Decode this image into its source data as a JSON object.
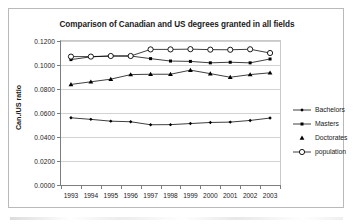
{
  "chart_data": {
    "type": "line",
    "title": "Comparison of Canadian and US degrees granted in all fields",
    "xlabel": "",
    "ylabel": "Can./US ratio",
    "grid": true,
    "legend_position": "right",
    "x": [
      "1993",
      "1994",
      "1995",
      "1996",
      "1997",
      "1998",
      "1999",
      "2000",
      "2001",
      "2002",
      "2003"
    ],
    "categories": [
      "1993",
      "1994",
      "1995",
      "1996",
      "1997",
      "1998",
      "1999",
      "2000",
      "2001",
      "2002",
      "2003"
    ],
    "ylim": [
      0.0,
      0.12
    ],
    "ytick_labels": [
      "0.0000",
      "0.0200",
      "0.0400",
      "0.0600",
      "0.0800",
      "0.1000",
      "0.1200"
    ],
    "ytick_values": [
      0.0,
      0.02,
      0.04,
      0.06,
      0.08,
      0.1,
      0.12
    ],
    "series": [
      {
        "name": "Bachelors",
        "marker": "diamond-filled",
        "color": "#000000",
        "values": [
          0.056,
          0.0547,
          0.0532,
          0.0527,
          0.0502,
          0.0503,
          0.0512,
          0.0521,
          0.0524,
          0.0538,
          0.0558
        ]
      },
      {
        "name": "Masters",
        "marker": "square-filled",
        "color": "#000000",
        "values": [
          0.1045,
          0.1068,
          0.1075,
          0.1075,
          0.1053,
          0.1033,
          0.103,
          0.1018,
          0.1023,
          0.1018,
          0.105
        ]
      },
      {
        "name": "Doctorates",
        "marker": "triangle-filled",
        "color": "#000000",
        "values": [
          0.0838,
          0.086,
          0.0882,
          0.092,
          0.0923,
          0.0923,
          0.0957,
          0.0928,
          0.0898,
          0.092,
          0.0935
        ]
      },
      {
        "name": "population",
        "marker": "circle-open",
        "color": "#000000",
        "values": [
          0.107,
          0.107,
          0.1075,
          0.1075,
          0.113,
          0.113,
          0.1132,
          0.1128,
          0.1127,
          0.1131,
          0.11
        ]
      }
    ]
  },
  "legend": {
    "items": [
      {
        "label": "Bachelors"
      },
      {
        "label": "Masters"
      },
      {
        "label": "Doctorates"
      },
      {
        "label": "population"
      }
    ]
  }
}
